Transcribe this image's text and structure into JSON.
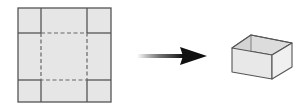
{
  "diagram": {
    "colors": {
      "fill": "#e6e6e6",
      "line": "#555555",
      "dash": "#666666",
      "arrow": "#111111",
      "box_front": "#e8e8e8",
      "box_side": "#f0f0f0",
      "box_inner": "#dcdcdc"
    },
    "net": {
      "label": "flat sheet net",
      "outer": {
        "x": 18,
        "y": 8,
        "w": 93,
        "h": 94
      },
      "cut_lines": {
        "x1": 41,
        "x2": 87,
        "y1": 33,
        "y2": 80
      },
      "fold_lines": "dashed"
    },
    "arrow": {
      "label": "folds into",
      "x_start": 137,
      "x_end": 207,
      "y": 56
    },
    "box": {
      "label": "open-top box"
    }
  }
}
